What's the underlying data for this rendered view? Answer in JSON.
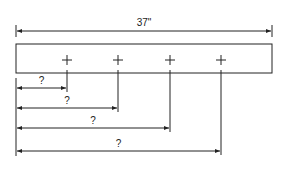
{
  "diagram": {
    "type": "dimension-drawing",
    "overall_length_label": "37\"",
    "board": {
      "x": 16,
      "y": 44,
      "width": 256,
      "height": 29
    },
    "overall_dim": {
      "y": 31,
      "x1": 16,
      "x2": 272
    },
    "marks": [
      {
        "x": 67,
        "y": 60,
        "dim_y": 88,
        "label": "?"
      },
      {
        "x": 118,
        "y": 60,
        "dim_y": 108,
        "label": "?"
      },
      {
        "x": 170,
        "y": 60,
        "dim_y": 128,
        "label": "?"
      },
      {
        "x": 221,
        "y": 60,
        "dim_y": 151,
        "label": "?"
      }
    ],
    "line_color": "#222222"
  }
}
